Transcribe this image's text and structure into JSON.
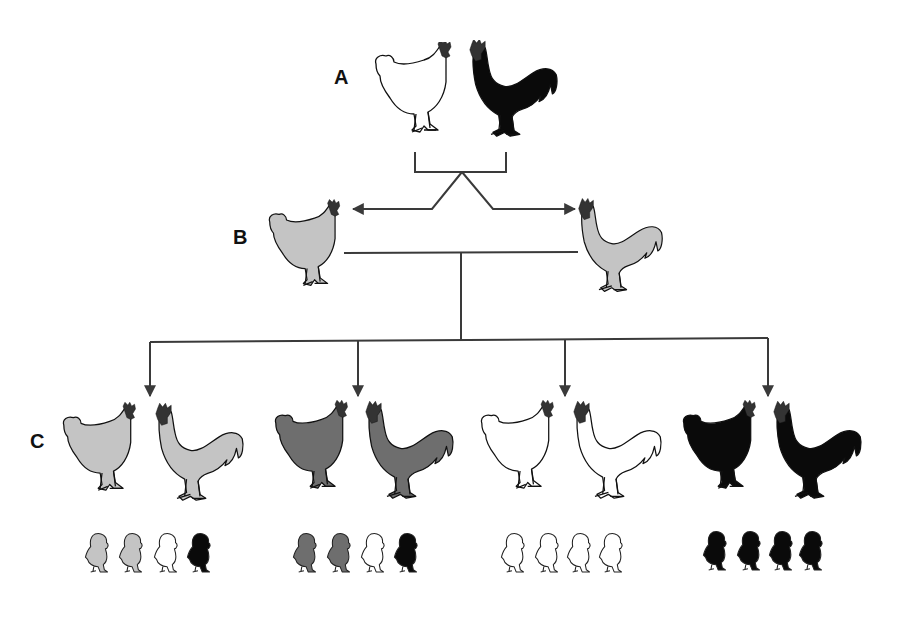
{
  "generations": {
    "A": {
      "label": "A",
      "parents": [
        {
          "sex": "hen",
          "color": "white"
        },
        {
          "sex": "rooster",
          "color": "black"
        }
      ]
    },
    "B": {
      "label": "B",
      "parents": [
        {
          "sex": "hen",
          "color": "light-gray"
        },
        {
          "sex": "rooster",
          "color": "light-gray"
        }
      ]
    },
    "C": {
      "label": "C",
      "crosses": [
        {
          "hen": "light-gray",
          "rooster": "light-gray",
          "chicks": [
            "light-gray",
            "light-gray",
            "white",
            "black"
          ]
        },
        {
          "hen": "dark-gray",
          "rooster": "dark-gray",
          "chicks": [
            "dark-gray",
            "dark-gray",
            "white",
            "black"
          ]
        },
        {
          "hen": "white",
          "rooster": "white",
          "chicks": [
            "white",
            "white",
            "white",
            "white"
          ]
        },
        {
          "hen": "black",
          "rooster": "black",
          "chicks": [
            "black",
            "black",
            "black",
            "black"
          ]
        }
      ]
    }
  },
  "colors": {
    "white": "#ffffff",
    "light-gray": "#c4c4c4",
    "dark-gray": "#6e6e6e",
    "black": "#0a0a0a",
    "comb": "#333333",
    "line": "#3a3a3a"
  }
}
